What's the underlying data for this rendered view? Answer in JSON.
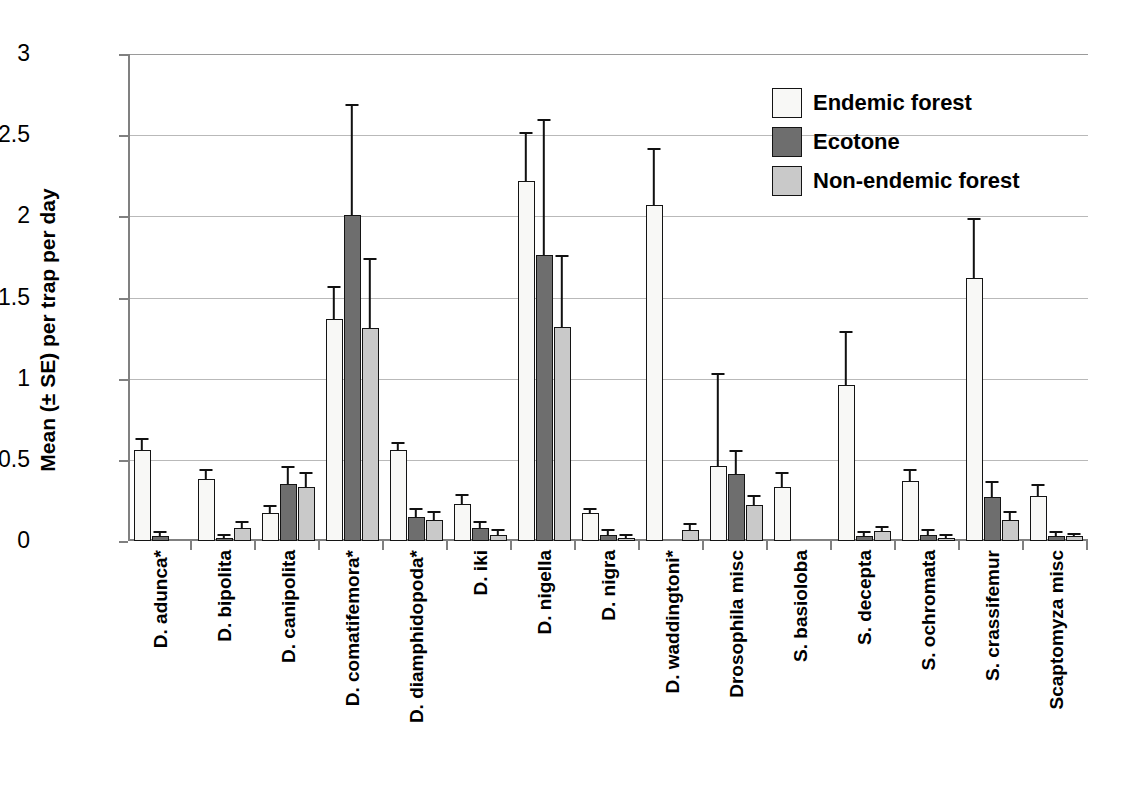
{
  "chart_data": {
    "type": "bar",
    "title": "",
    "xlabel": "",
    "ylabel": "Mean (± SE) per trap per day",
    "ylim": [
      0,
      3
    ],
    "yticks": [
      0,
      0.5,
      1,
      1.5,
      2,
      2.5,
      3
    ],
    "ytick_labels": [
      "0",
      "0.5",
      "1",
      "1.5",
      "2",
      "2.5",
      "3"
    ],
    "grid": true,
    "legend_position": "top-right",
    "error_bars": "SE",
    "categories": [
      "D. adunca*",
      "D. bipolita",
      "D. canipolita",
      "D. comatifemora*",
      "D. diamphidopoda*",
      "D. iki",
      "D. nigella",
      "D. nigra",
      "D. waddingtoni*",
      "Drosophila misc",
      "S. basioloba",
      "S. decepta",
      "S. ochromata",
      "S. crassifemur",
      "Scaptomyza misc"
    ],
    "series": [
      {
        "name": "Endemic forest",
        "color": "#f8f8f6",
        "values": [
          0.56,
          0.38,
          0.17,
          1.37,
          0.56,
          0.23,
          2.22,
          0.17,
          2.07,
          0.46,
          0.33,
          0.96,
          0.37,
          1.62,
          0.28
        ],
        "errors": [
          0.06,
          0.05,
          0.04,
          0.19,
          0.04,
          0.05,
          0.29,
          0.02,
          0.34,
          0.56,
          0.08,
          0.32,
          0.06,
          0.36,
          0.06
        ]
      },
      {
        "name": "Ecotone",
        "color": "#6e6e6e",
        "values": [
          0.03,
          0.02,
          0.35,
          2.01,
          0.15,
          0.08,
          1.76,
          0.04,
          null,
          0.41,
          null,
          0.03,
          0.04,
          0.27,
          0.03
        ],
        "errors": [
          0.02,
          0.01,
          0.1,
          0.67,
          0.04,
          0.03,
          0.83,
          0.02,
          null,
          0.14,
          null,
          0.02,
          0.02,
          0.09,
          0.02
        ]
      },
      {
        "name": "Non-endemic forest",
        "color": "#c9c9c9",
        "values": [
          null,
          0.08,
          0.33,
          1.31,
          0.13,
          0.04,
          1.32,
          0.02,
          0.07,
          0.22,
          null,
          0.06,
          0.02,
          0.13,
          0.03
        ],
        "errors": [
          null,
          0.03,
          0.08,
          0.42,
          0.04,
          0.02,
          0.43,
          0.01,
          0.03,
          0.05,
          null,
          0.02,
          0.01,
          0.04,
          0.01
        ]
      }
    ]
  },
  "legend": {
    "items": [
      {
        "label": "Endemic forest"
      },
      {
        "label": "Ecotone"
      },
      {
        "label": "Non-endemic forest"
      }
    ]
  }
}
